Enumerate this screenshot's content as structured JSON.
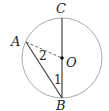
{
  "diagram": {
    "type": "geometry-circle",
    "circle": {
      "center": "O",
      "cx": 62,
      "cy": 58,
      "r": 40
    },
    "points": {
      "C": {
        "label": "C",
        "x": 62,
        "y": 18
      },
      "B": {
        "label": "B",
        "x": 62,
        "y": 98
      },
      "A": {
        "label": "A",
        "x": 26,
        "y": 42
      },
      "O": {
        "label": "O",
        "x": 62,
        "y": 58
      }
    },
    "segments": [
      {
        "from": "C",
        "to": "B",
        "style": "solid"
      },
      {
        "from": "A",
        "to": "B",
        "style": "solid"
      },
      {
        "from": "A",
        "to": "O",
        "style": "dashed"
      }
    ],
    "angles": {
      "angle1": {
        "label": "1"
      },
      "angle2": {
        "label": "2"
      }
    },
    "colors": {
      "circle": "#aaaaaa",
      "line": "#333333"
    }
  }
}
